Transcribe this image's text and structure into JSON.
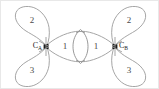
{
  "figure": {
    "background_color": "#ffffff",
    "border_color": "#e8e8e8",
    "outline_color": "#9b9b9b",
    "nucleus_color": "#1c1c1c",
    "label_color": "#1c1c1c",
    "number_color": "#4a4a4a"
  },
  "atoms": [
    {
      "id": "atom-a",
      "element": "C",
      "subscript": "A",
      "label_full": "CA",
      "nucleus_x": 45,
      "nucleus_y": 45.5
    },
    {
      "id": "atom-b",
      "element": "C",
      "subscript": "B",
      "label_full": "CB",
      "nucleus_x": 114,
      "nucleus_y": 45.5
    }
  ],
  "lobes": [
    {
      "id": "lobe-a-top",
      "atom": "atom-a",
      "number": "2",
      "label_x": 31,
      "label_y": 20
    },
    {
      "id": "lobe-a-bottom",
      "atom": "atom-a",
      "number": "3",
      "label_x": 31,
      "label_y": 70
    },
    {
      "id": "lobe-a-bond",
      "atom": "atom-a",
      "number": "1",
      "label_x": 64,
      "label_y": 45.5
    },
    {
      "id": "lobe-b-top",
      "atom": "atom-b",
      "number": "2",
      "label_x": 128,
      "label_y": 20
    },
    {
      "id": "lobe-b-bottom",
      "atom": "atom-b",
      "number": "3",
      "label_x": 128,
      "label_y": 70
    },
    {
      "id": "lobe-b-bond",
      "atom": "atom-b",
      "number": "1",
      "label_x": 95,
      "label_y": 45.5
    }
  ],
  "overlap": {
    "id": "sigma-overlap-lens",
    "name": "sigma-bond-overlap-region",
    "center_x": 79.5,
    "center_y": 45.5,
    "half_width": 7.5,
    "half_height": 17
  }
}
